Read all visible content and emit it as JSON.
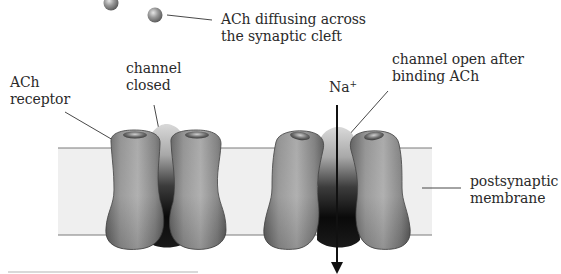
{
  "diagram": {
    "type": "biology-illustration",
    "labels": {
      "ach_diffusing_line1": "ACh diffusing across",
      "ach_diffusing_line2": "the synaptic cleft",
      "ach_receptor_line1": "ACh",
      "ach_receptor_line2": "receptor",
      "channel_closed_line1": "channel",
      "channel_closed_line2": "closed",
      "channel_open_line1": "channel open after",
      "channel_open_line2": "binding ACh",
      "ion": "Na",
      "ion_charge": "+",
      "membrane_line1": "postsynaptic",
      "membrane_line2": "membrane"
    },
    "elements": [
      {
        "name": "ACh molecule",
        "count": 2
      },
      {
        "name": "ACh receptor (closed channel)",
        "state": "closed"
      },
      {
        "name": "ACh receptor (open channel)",
        "state": "open"
      },
      {
        "name": "Na+ flow arrow",
        "direction": "down through open channel"
      },
      {
        "name": "postsynaptic membrane",
        "style": "light gray band"
      }
    ],
    "colors": {
      "membrane_fill": "#eeeeee",
      "membrane_edge": "#7a7a7a",
      "protein_mid": "#8a8a8a",
      "protein_dark": "#3a3a3a",
      "pore_dark": "#0d0d0d",
      "leader_line": "#333333",
      "text": "#2a2a2a"
    }
  }
}
